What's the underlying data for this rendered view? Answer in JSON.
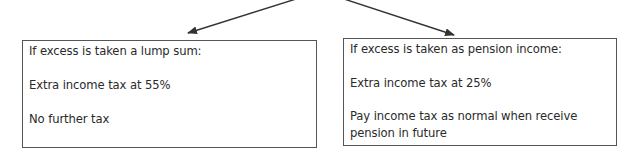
{
  "diagram": {
    "arrows": [
      {
        "from": "top-center",
        "to": "left-box"
      },
      {
        "from": "top-center",
        "to": "right-box"
      }
    ],
    "boxes": {
      "left": {
        "heading": "If excess is taken a lump sum:",
        "line1": "Extra income tax at 55%",
        "line2": "No further tax"
      },
      "right": {
        "heading": "If excess is taken as pension income:",
        "line1": "Extra income tax at 25%",
        "line2a": "Pay income tax as normal when receive",
        "line2b": "pension in future"
      }
    },
    "colors": {
      "border": "#555555",
      "arrow": "#333333",
      "text": "#2a2a2a"
    }
  }
}
